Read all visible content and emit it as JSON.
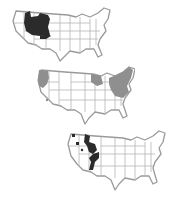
{
  "figure": {
    "maps": [
      {
        "id": "map-1",
        "description": "US map with northern Rockies region (Idaho/Montana/Wyoming area) highlighted, plus a small patch in Colorado/Utah",
        "highlight_color": "#2b2b2b",
        "position": {
          "left": 10,
          "top": 5,
          "width": 102,
          "height": 56
        }
      },
      {
        "id": "map-2",
        "description": "US map with Pacific Northwest coast, Great Lakes (Wisconsin/Michigan) and Northeast states shaded grey",
        "highlight_color": "#8f8f8f",
        "position": {
          "left": 35,
          "top": 64,
          "width": 98,
          "height": 60
        }
      },
      {
        "id": "map-3",
        "description": "US map with a north-south band through Idaho/Montana/Wyoming down to Utah/Colorado highlighted, plus small spots in Washington",
        "highlight_color": "#2b2b2b",
        "position": {
          "left": 65,
          "top": 128,
          "width": 103,
          "height": 63
        }
      }
    ]
  }
}
